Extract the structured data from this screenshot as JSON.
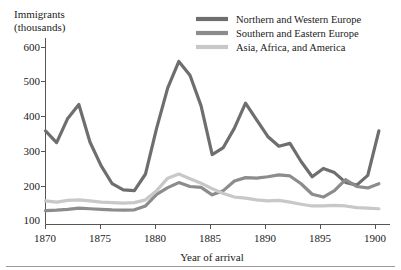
{
  "chart_data": {
    "type": "line",
    "title": "",
    "ylabel": "Immigrants (thousands)",
    "ylabel_line1": "Immigrants",
    "ylabel_line2": "(thousands)",
    "xlabel": "Year of arrival",
    "xlim": [
      1870,
      1901
    ],
    "ylim": [
      0,
      640
    ],
    "grid": false,
    "legend_position": "top-right",
    "yticks": [
      100,
      200,
      300,
      400,
      500,
      600
    ],
    "ytick_labels": [
      "100",
      "200",
      "300",
      "400",
      "500",
      "600"
    ],
    "xticks": [
      1870,
      1875,
      1880,
      1885,
      1890,
      1895,
      1900
    ],
    "xtick_labels": [
      "1870",
      "1875",
      "1880",
      "1885",
      "1890",
      "1895",
      "1900"
    ],
    "x": [
      1870,
      1871,
      1872,
      1873,
      1874,
      1875,
      1876,
      1877,
      1878,
      1879,
      1880,
      1881,
      1882,
      1883,
      1884,
      1885,
      1886,
      1887,
      1888,
      1889,
      1890,
      1891,
      1892,
      1893,
      1894,
      1895,
      1896,
      1897,
      1898,
      1899,
      1900
    ],
    "series": [
      {
        "name": "Northern and Western Europe",
        "color": "#6e6e6e",
        "values": [
          300,
          258,
          345,
          395,
          260,
          175,
          110,
          88,
          85,
          145,
          310,
          455,
          550,
          500,
          390,
          215,
          240,
          310,
          400,
          340,
          280,
          245,
          255,
          190,
          135,
          165,
          150,
          115,
          105,
          140,
          300
        ]
      },
      {
        "name": "Southern and Eastern Europe",
        "color": "#8c8c8c",
        "values": [
          13,
          15,
          18,
          22,
          20,
          18,
          16,
          15,
          16,
          30,
          72,
          96,
          114,
          100,
          97,
          70,
          85,
          120,
          132,
          130,
          135,
          142,
          138,
          110,
          72,
          62,
          85,
          125,
          100,
          95,
          110
        ]
      },
      {
        "name": "Asia, Africa, and America",
        "color": "#c8c8c8",
        "values": [
          48,
          44,
          50,
          52,
          48,
          44,
          42,
          40,
          42,
          52,
          85,
          130,
          145,
          128,
          112,
          92,
          75,
          62,
          58,
          52,
          48,
          50,
          44,
          36,
          30,
          30,
          32,
          30,
          24,
          22,
          20
        ]
      }
    ],
    "legend": [
      {
        "label": "Northern and Western Europe",
        "color": "#6e6e6e"
      },
      {
        "label": "Southern and Eastern Europe",
        "color": "#8c8c8c"
      },
      {
        "label": "Asia, Africa, and America",
        "color": "#c8c8c8"
      }
    ]
  }
}
